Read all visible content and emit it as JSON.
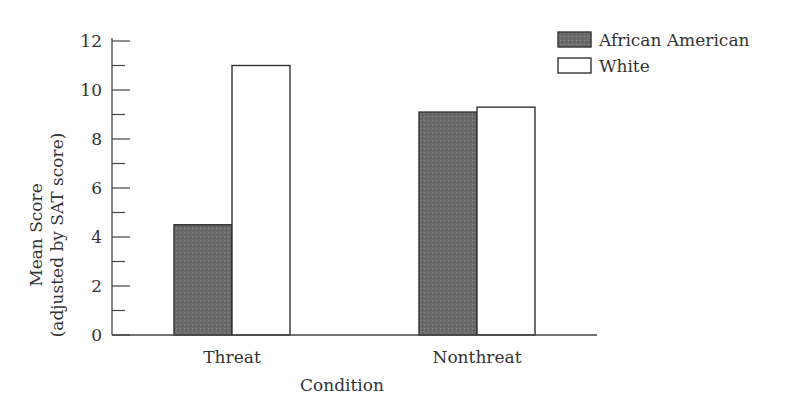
{
  "chart_data": {
    "type": "bar",
    "title": "",
    "xlabel": "Condition",
    "ylabel_line1": "Mean Score",
    "ylabel_line2": "(adjusted by SAT score)",
    "ylim": [
      0,
      12
    ],
    "y_major_ticks": [
      0,
      2,
      4,
      6,
      8,
      10,
      12
    ],
    "y_minor_ticks": [
      1,
      3,
      5,
      7,
      9,
      11
    ],
    "grid": false,
    "legend_position": "top-right",
    "categories": [
      "Threat",
      "Nonthreat"
    ],
    "series": [
      {
        "name": "African American",
        "values": [
          4.5,
          9.1
        ],
        "color": "#6e6e6e"
      },
      {
        "name": "White",
        "values": [
          11.0,
          9.3
        ],
        "color": "#ffffff"
      }
    ]
  }
}
